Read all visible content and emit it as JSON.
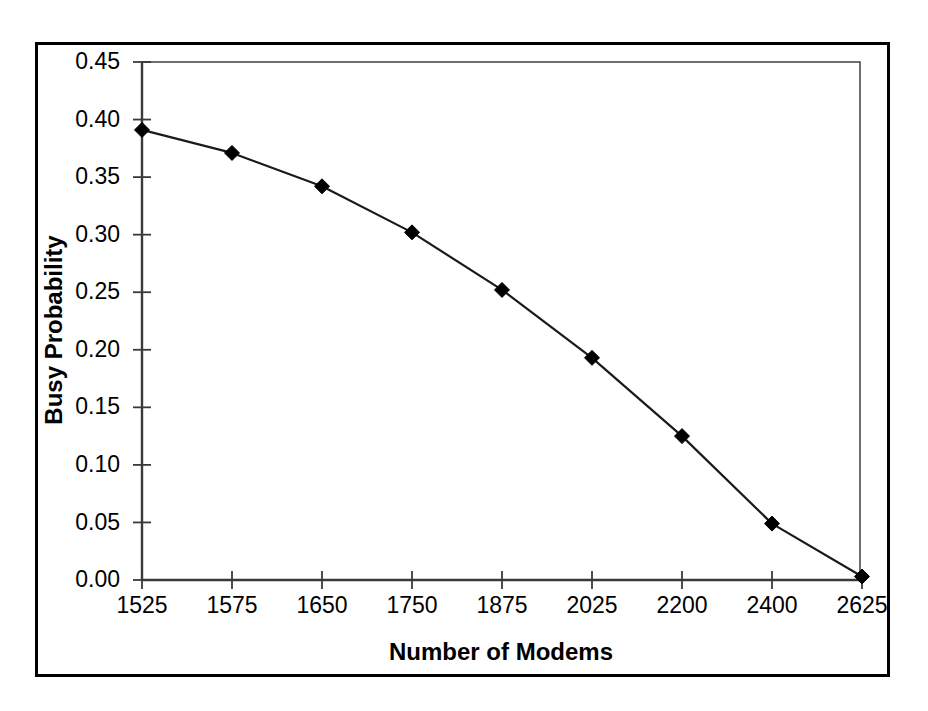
{
  "chart_data": {
    "type": "line",
    "title": "",
    "xlabel": "Number of Modems",
    "ylabel": "Busy Probability",
    "categories": [
      "1525",
      "1575",
      "1650",
      "1750",
      "1875",
      "2025",
      "2200",
      "2400",
      "2625"
    ],
    "values": [
      0.391,
      0.371,
      0.342,
      0.302,
      0.252,
      0.193,
      0.125,
      0.049,
      0.003
    ],
    "series": [
      {
        "name": "Busy Probability",
        "values": [
          0.391,
          0.371,
          0.342,
          0.302,
          0.252,
          0.193,
          0.125,
          0.049,
          0.003
        ]
      }
    ],
    "ylim": [
      0.0,
      0.45
    ],
    "ytick_labels": [
      "0.00",
      "0.05",
      "0.10",
      "0.15",
      "0.20",
      "0.25",
      "0.30",
      "0.35",
      "0.40",
      "0.45"
    ],
    "ytick_values": [
      0.0,
      0.05,
      0.1,
      0.15,
      0.2,
      0.25,
      0.3,
      0.35,
      0.4,
      0.45
    ],
    "xtick_labels": [
      "1525",
      "1575",
      "1650",
      "1750",
      "1875",
      "2025",
      "2200",
      "2400",
      "2625"
    ],
    "grid": false,
    "legend": false,
    "legend_position": "none",
    "marker": "diamond",
    "line_color": "#000000",
    "marker_color": "#000000",
    "background_color": "#ffffff",
    "border_color": "#000000"
  },
  "axis": {
    "y_title": "Busy Probability",
    "x_title": "Number of Modems"
  },
  "ticks": {
    "y": [
      {
        "label": "0.45",
        "value": 0.45
      },
      {
        "label": "0.40",
        "value": 0.4
      },
      {
        "label": "0.35",
        "value": 0.35
      },
      {
        "label": "0.30",
        "value": 0.3
      },
      {
        "label": "0.25",
        "value": 0.25
      },
      {
        "label": "0.20",
        "value": 0.2
      },
      {
        "label": "0.15",
        "value": 0.15
      },
      {
        "label": "0.10",
        "value": 0.1
      },
      {
        "label": "0.05",
        "value": 0.05
      },
      {
        "label": "0.00",
        "value": 0.0
      }
    ],
    "x": [
      {
        "label": "1525"
      },
      {
        "label": "1575"
      },
      {
        "label": "1650"
      },
      {
        "label": "1750"
      },
      {
        "label": "1875"
      },
      {
        "label": "2025"
      },
      {
        "label": "2200"
      },
      {
        "label": "2400"
      },
      {
        "label": "2625"
      }
    ]
  }
}
